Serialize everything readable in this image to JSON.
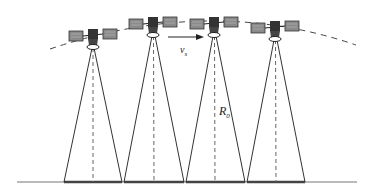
{
  "diagram": {
    "type": "satellite-constellation-footprint",
    "satellites_count": 4,
    "labels": {
      "velocity": "v",
      "velocity_sub": "s",
      "radius": "R",
      "radius_sub": "0"
    },
    "colors": {
      "line": "#333333",
      "dashed": "#555555",
      "panel": "#8a8a8a",
      "ground": "#555555"
    }
  }
}
